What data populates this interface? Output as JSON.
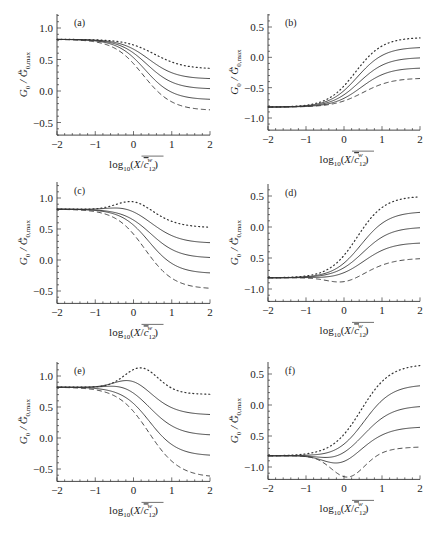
{
  "figure": {
    "xlabel": "log10(X/c12w)",
    "ylabel": "G0 / G0,max"
  },
  "chart_data": [
    {
      "type": "line",
      "panel": "(a)",
      "xlabel": "log10(X / c̄12^w)",
      "ylabel": "G0 / G0,max^0",
      "xlim": [
        -2,
        2
      ],
      "ylim": [
        -0.7,
        1.2
      ],
      "xticks": [
        -2,
        -1,
        0,
        1,
        2
      ],
      "yticks": [
        1.0,
        0.5,
        0.0,
        -0.5
      ],
      "ytick_labels": [
        "1.0",
        "0.5",
        "0.0",
        "-0.5"
      ],
      "series": [
        {
          "name": "dotted",
          "style": "dotted",
          "start": 0.82,
          "end": 0.35,
          "center": 0.55,
          "width": 0.38,
          "bump": 0.0,
          "bump_center": 0
        },
        {
          "name": "solid 1",
          "style": "solid",
          "start": 0.82,
          "end": 0.19,
          "center": 0.4,
          "width": 0.36,
          "bump": 0.0,
          "bump_center": 0
        },
        {
          "name": "solid 2",
          "style": "solid",
          "start": 0.82,
          "end": 0.03,
          "center": 0.35,
          "width": 0.36,
          "bump": 0.0,
          "bump_center": 0
        },
        {
          "name": "solid 3",
          "style": "solid",
          "start": 0.82,
          "end": -0.14,
          "center": 0.3,
          "width": 0.36,
          "bump": 0.0,
          "bump_center": 0
        },
        {
          "name": "dashed",
          "style": "dashed",
          "start": 0.82,
          "end": -0.31,
          "center": 0.25,
          "width": 0.38,
          "bump": 0.0,
          "bump_center": 0
        }
      ]
    },
    {
      "type": "line",
      "panel": "(b)",
      "xlabel": "log10(X / c̄12^w)",
      "ylabel": "G0 / G0,max^0",
      "xlim": [
        -2,
        2
      ],
      "ylim": [
        -1.2,
        0.7
      ],
      "xticks": [
        -2,
        -1,
        0,
        1,
        2
      ],
      "yticks": [
        0.5,
        0.0,
        -0.5,
        -1.0
      ],
      "ytick_labels": [
        "0.5",
        "0.0",
        "-0.5",
        "-1.0"
      ],
      "series": [
        {
          "name": "dotted",
          "style": "dotted",
          "start": -0.82,
          "end": 0.33,
          "center": 0.3,
          "width": 0.36,
          "bump": 0.0,
          "bump_center": 0
        },
        {
          "name": "solid 1",
          "style": "solid",
          "start": -0.82,
          "end": 0.17,
          "center": 0.35,
          "width": 0.36,
          "bump": 0.0,
          "bump_center": 0
        },
        {
          "name": "solid 2",
          "style": "solid",
          "start": -0.82,
          "end": 0.0,
          "center": 0.4,
          "width": 0.36,
          "bump": 0.0,
          "bump_center": 0
        },
        {
          "name": "solid 3",
          "style": "solid",
          "start": -0.82,
          "end": -0.17,
          "center": 0.45,
          "width": 0.36,
          "bump": 0.0,
          "bump_center": 0
        },
        {
          "name": "dashed",
          "style": "dashed",
          "start": -0.82,
          "end": -0.34,
          "center": 0.5,
          "width": 0.38,
          "bump": 0.0,
          "bump_center": 0
        }
      ]
    },
    {
      "type": "line",
      "panel": "(c)",
      "xlabel": "log10(X / c̄12^w)",
      "ylabel": "G0 / G0,max^0",
      "xlim": [
        -2,
        2
      ],
      "ylim": [
        -0.7,
        1.2
      ],
      "xticks": [
        -2,
        -1,
        0,
        1,
        2
      ],
      "yticks": [
        1.0,
        0.5,
        0.0,
        -0.5
      ],
      "ytick_labels": [
        "1.0",
        "0.5",
        "0.0",
        "-0.5"
      ],
      "series": [
        {
          "name": "dotted",
          "style": "dotted",
          "start": 0.82,
          "end": 0.52,
          "center": 0.7,
          "width": 0.38,
          "bump": 0.16,
          "bump_center": 0.0
        },
        {
          "name": "solid 1",
          "style": "solid",
          "start": 0.82,
          "end": 0.27,
          "center": 0.55,
          "width": 0.36,
          "bump": 0.06,
          "bump_center": -0.2
        },
        {
          "name": "solid 2",
          "style": "solid",
          "start": 0.82,
          "end": 0.03,
          "center": 0.45,
          "width": 0.36,
          "bump": 0.0,
          "bump_center": 0
        },
        {
          "name": "solid 3",
          "style": "solid",
          "start": 0.82,
          "end": -0.22,
          "center": 0.4,
          "width": 0.36,
          "bump": 0.0,
          "bump_center": 0
        },
        {
          "name": "dashed",
          "style": "dashed",
          "start": 0.82,
          "end": -0.47,
          "center": 0.3,
          "width": 0.38,
          "bump": 0.0,
          "bump_center": 0
        }
      ]
    },
    {
      "type": "line",
      "panel": "(d)",
      "xlabel": "log10(X / c̄12^w)",
      "ylabel": "G0 / G0,max^0",
      "xlim": [
        -2,
        2
      ],
      "ylim": [
        -1.2,
        0.7
      ],
      "xticks": [
        -2,
        -1,
        0,
        1,
        2
      ],
      "yticks": [
        0.5,
        0.0,
        -0.5,
        -1.0
      ],
      "ytick_labels": [
        "0.5",
        "0.0",
        "0.5",
        "-1.0"
      ],
      "series": [
        {
          "name": "dotted",
          "style": "dotted",
          "start": -0.82,
          "end": 0.5,
          "center": 0.35,
          "width": 0.36,
          "bump": 0.0,
          "bump_center": 0
        },
        {
          "name": "solid 1",
          "style": "solid",
          "start": -0.82,
          "end": 0.25,
          "center": 0.45,
          "width": 0.36,
          "bump": 0.0,
          "bump_center": 0
        },
        {
          "name": "solid 2",
          "style": "solid",
          "start": -0.82,
          "end": 0.0,
          "center": 0.5,
          "width": 0.36,
          "bump": 0.0,
          "bump_center": 0
        },
        {
          "name": "solid 3",
          "style": "solid",
          "start": -0.82,
          "end": -0.25,
          "center": 0.55,
          "width": 0.36,
          "bump": -0.02,
          "bump_center": -0.2
        },
        {
          "name": "dashed",
          "style": "dashed",
          "start": -0.82,
          "end": -0.5,
          "center": 0.75,
          "width": 0.38,
          "bump": -0.1,
          "bump_center": 0.0
        }
      ]
    },
    {
      "type": "line",
      "panel": "(e)",
      "xlabel": "log10(X / c̄12^w)",
      "ylabel": "G0 / G0,max^0",
      "xlim": [
        -2,
        2
      ],
      "ylim": [
        -0.7,
        1.2
      ],
      "xticks": [
        -2,
        -1,
        0,
        1,
        2
      ],
      "yticks": [
        1.0,
        0.5,
        0.0,
        -0.5
      ],
      "ytick_labels": [
        "1.0",
        "0.5",
        "0.0",
        "-0.5"
      ],
      "series": [
        {
          "name": "dotted",
          "style": "dotted",
          "start": 0.82,
          "end": 0.7,
          "center": 0.85,
          "width": 0.38,
          "bump": 0.33,
          "bump_center": 0.2
        },
        {
          "name": "solid 1",
          "style": "solid",
          "start": 0.82,
          "end": 0.37,
          "center": 0.6,
          "width": 0.36,
          "bump": 0.16,
          "bump_center": -0.05
        },
        {
          "name": "solid 2",
          "style": "solid",
          "start": 0.82,
          "end": 0.04,
          "center": 0.5,
          "width": 0.36,
          "bump": 0.07,
          "bump_center": -0.25
        },
        {
          "name": "solid 3",
          "style": "solid",
          "start": 0.82,
          "end": -0.29,
          "center": 0.42,
          "width": 0.36,
          "bump": 0.0,
          "bump_center": 0
        },
        {
          "name": "dashed",
          "style": "dashed",
          "start": 0.82,
          "end": -0.64,
          "center": 0.4,
          "width": 0.4,
          "bump": 0.0,
          "bump_center": 0
        }
      ]
    },
    {
      "type": "line",
      "panel": "(f)",
      "xlabel": "log10(X / c̄12^w)",
      "ylabel": "G0 / G0,max^0",
      "xlim": [
        -2,
        2
      ],
      "ylim": [
        -1.2,
        0.7
      ],
      "xticks": [
        -2,
        -1,
        0,
        1,
        2
      ],
      "yticks": [
        0.5,
        0.0,
        -0.5,
        -1.0
      ],
      "ytick_labels": [
        "0.5",
        "0.0",
        "0.5",
        "-1.0"
      ],
      "series": [
        {
          "name": "dotted",
          "style": "dotted",
          "start": -0.82,
          "end": 0.66,
          "center": 0.45,
          "width": 0.38,
          "bump": 0.0,
          "bump_center": 0
        },
        {
          "name": "solid 1",
          "style": "solid",
          "start": -0.82,
          "end": 0.33,
          "center": 0.55,
          "width": 0.36,
          "bump": -0.02,
          "bump_center": -0.3
        },
        {
          "name": "solid 2",
          "style": "solid",
          "start": -0.82,
          "end": -0.01,
          "center": 0.6,
          "width": 0.36,
          "bump": -0.08,
          "bump_center": -0.2
        },
        {
          "name": "solid 3",
          "style": "solid",
          "start": -0.82,
          "end": -0.35,
          "center": 0.65,
          "width": 0.36,
          "bump": -0.16,
          "bump_center": -0.1
        },
        {
          "name": "dashed",
          "style": "dashed",
          "start": -0.82,
          "end": -0.67,
          "center": 0.9,
          "width": 0.4,
          "bump": -0.36,
          "bump_center": 0.1
        }
      ]
    }
  ],
  "panels_layout": [
    {
      "left": 57,
      "right": 210,
      "top": 14,
      "y_val_a": 1.0,
      "y_px_a": 28,
      "y_val_b": 0.0,
      "y_px_b": 91
    },
    {
      "left": 268,
      "right": 420,
      "top": 14,
      "y_val_a": 0.5,
      "y_px_a": 27,
      "y_val_b": -1.0,
      "y_px_b": 118
    },
    {
      "left": 57,
      "right": 210,
      "top": 182,
      "y_val_a": 1.0,
      "y_px_a": 198,
      "y_val_b": 0.0,
      "y_px_b": 260
    },
    {
      "left": 268,
      "right": 420,
      "top": 184,
      "y_val_a": 0.5,
      "y_px_a": 196,
      "y_val_b": -1.0,
      "y_px_b": 289
    },
    {
      "left": 57,
      "right": 210,
      "top": 362,
      "y_val_a": 1.0,
      "y_px_a": 376,
      "y_val_b": 0.0,
      "y_px_b": 438
    },
    {
      "left": 268,
      "right": 420,
      "top": 362,
      "y_val_a": 0.5,
      "y_px_a": 374,
      "y_val_b": -1.0,
      "y_px_b": 467
    }
  ]
}
